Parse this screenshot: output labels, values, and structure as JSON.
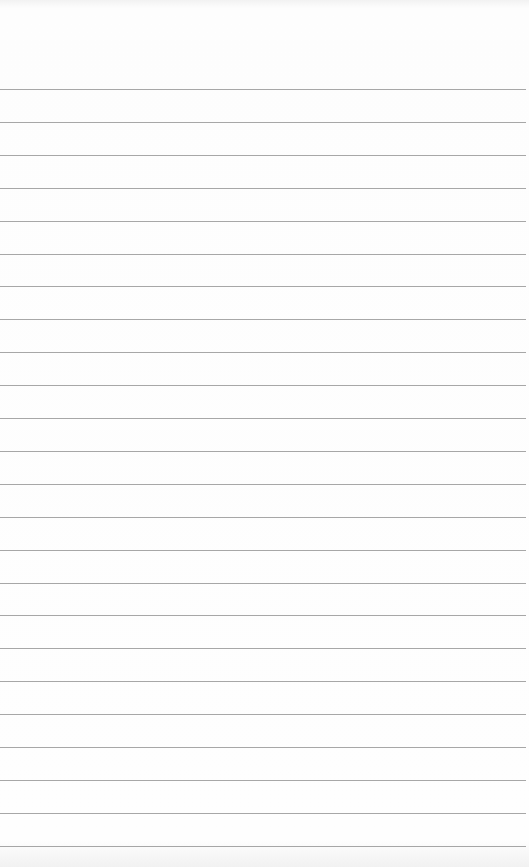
{
  "page": {
    "type": "blank lined paper",
    "background_color": "#fbfbfb",
    "rule_color": "#8a8a8a",
    "rule_count": 24,
    "first_rule_y": 89,
    "rule_spacing": 32.9
  }
}
